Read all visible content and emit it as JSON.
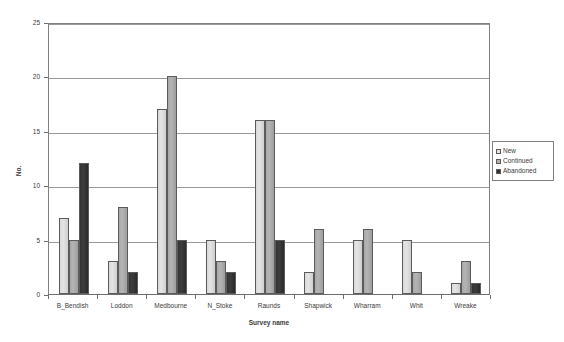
{
  "chart_data": {
    "type": "bar",
    "title": "",
    "xlabel": "Survey name",
    "ylabel": "No.",
    "ylim": [
      0,
      25
    ],
    "yticks": [
      0,
      5,
      10,
      15,
      20,
      25
    ],
    "grid": true,
    "legend_position": "right",
    "categories": [
      "B_Bendish",
      "Loddon",
      "Medbourne",
      "N_Stoke",
      "Raunds",
      "Shapwick",
      "Wharram",
      "Whit",
      "Wreake"
    ],
    "series": [
      {
        "name": "New",
        "color": "#e4e4e4",
        "values": [
          7,
          3,
          17,
          5,
          16,
          2,
          5,
          5,
          1
        ]
      },
      {
        "name": "Continued",
        "color": "#b0b0b0",
        "values": [
          5,
          8,
          20,
          3,
          16,
          6,
          6,
          2,
          3
        ]
      },
      {
        "name": "Abandoned",
        "color": "#333333",
        "values": [
          12,
          2,
          5,
          2,
          5,
          0,
          0,
          0,
          1
        ]
      }
    ]
  },
  "legend": {
    "items": [
      {
        "label": "New"
      },
      {
        "label": "Continued"
      },
      {
        "label": "Abandoned"
      }
    ]
  }
}
